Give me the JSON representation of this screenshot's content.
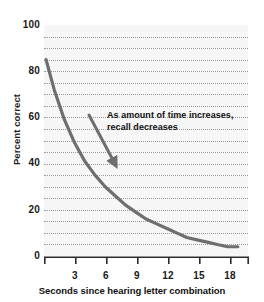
{
  "chart_data": {
    "type": "line",
    "title": "",
    "xlabel": "Seconds since hearing letter combination",
    "ylabel": "Percent correct",
    "xlim": [
      0,
      20
    ],
    "ylim": [
      0,
      100
    ],
    "x_ticks": [
      3,
      6,
      9,
      12,
      15,
      18
    ],
    "x_tick_labels": [
      "3",
      "6",
      "9",
      "12",
      "15",
      "18"
    ],
    "y_ticks": [
      0,
      20,
      40,
      60,
      80,
      100
    ],
    "y_tick_labels": [
      "0",
      "20",
      "40",
      "60",
      "80",
      "100"
    ],
    "grid": true,
    "grid_style": "dotted-horizontal",
    "grid_interval": 5,
    "legend": "none",
    "series": [
      {
        "name": "Recall accuracy",
        "color": "#6e6e6e",
        "x": [
          0.2,
          1,
          2,
          3,
          4,
          5,
          6,
          7,
          8,
          9,
          10,
          11,
          12,
          13,
          14,
          15,
          16,
          17,
          18,
          19
        ],
        "values": [
          85,
          72,
          59,
          49,
          41,
          35,
          30,
          26,
          22,
          19,
          16,
          14,
          12,
          10,
          8,
          7,
          6,
          5,
          4,
          4
        ]
      }
    ],
    "annotations": [
      {
        "name": "trend-annotation",
        "line1": "As amount of time increases,",
        "line2": "recall decreases",
        "arrow": "down-right",
        "arrow_color": "#6e6e6e"
      }
    ]
  },
  "axes": {
    "y_title": "Percent correct",
    "x_title": "Seconds since hearing letter combination",
    "y_labels": [
      {
        "value": 100,
        "text": "100",
        "top": 20
      },
      {
        "value": 80,
        "text": "80",
        "top": 66
      },
      {
        "value": 60,
        "text": "60",
        "top": 112
      },
      {
        "value": 40,
        "text": "40",
        "top": 158
      },
      {
        "value": 20,
        "text": "20",
        "top": 205
      },
      {
        "value": 0,
        "text": "0",
        "top": 251
      }
    ],
    "x_labels": [
      {
        "value": 3,
        "text": "3",
        "left": 75
      },
      {
        "value": 6,
        "text": "6",
        "left": 106
      },
      {
        "value": 9,
        "text": "9",
        "left": 136
      },
      {
        "value": 12,
        "text": "12",
        "left": 167
      },
      {
        "value": 15,
        "text": "15",
        "left": 197
      },
      {
        "value": 18,
        "text": "18",
        "left": 228
      }
    ]
  },
  "colors": {
    "curve": "#6e6e6e",
    "arrow": "#6e6e6e",
    "grid": "#9a9a9a",
    "axis": "#2b2b2b",
    "plot_background": "#f6f6f6",
    "page_background": "#ffffff",
    "text": "#111111"
  }
}
